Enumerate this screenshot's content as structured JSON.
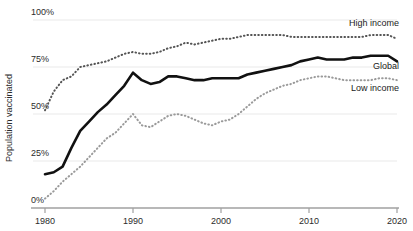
{
  "chart_data": {
    "type": "line",
    "title": "",
    "subtitle": "",
    "xlabel": "",
    "ylabel": "Population vaccinated",
    "xlim": [
      1980,
      2020
    ],
    "ylim": [
      0,
      100
    ],
    "grid": true,
    "grid_axis": "y",
    "legend_position": "right-inline",
    "x_ticks": [
      "1980",
      "1990",
      "2000",
      "2010",
      "2020"
    ],
    "x_tick_values": [
      1980,
      1990,
      2000,
      2010,
      2020
    ],
    "y_ticks": [
      "0%",
      "25%",
      "50%",
      "75%",
      "100%"
    ],
    "y_tick_values": [
      0,
      25,
      50,
      75,
      100
    ],
    "x": [
      1980,
      1981,
      1982,
      1983,
      1984,
      1985,
      1986,
      1987,
      1988,
      1989,
      1990,
      1991,
      1992,
      1993,
      1994,
      1995,
      1996,
      1997,
      1998,
      1999,
      2000,
      2001,
      2002,
      2003,
      2004,
      2005,
      2006,
      2007,
      2008,
      2009,
      2010,
      2011,
      2012,
      2013,
      2014,
      2015,
      2016,
      2017,
      2018,
      2019,
      2020
    ],
    "series": [
      {
        "name": "High income",
        "style": "dotted",
        "color": "#555555",
        "label_anchor_year": 2020,
        "label_anchor_value": 97,
        "values": [
          52,
          62,
          68,
          70,
          75,
          76,
          77,
          78,
          80,
          82,
          83,
          82,
          82,
          83,
          85,
          86,
          88,
          87,
          88,
          89,
          90,
          90,
          91,
          92,
          92,
          92,
          92,
          92,
          91,
          91,
          91,
          91,
          91,
          91,
          91,
          91,
          91,
          92,
          92,
          92,
          90
        ]
      },
      {
        "name": "Global",
        "style": "solid",
        "color": "#111111",
        "label_anchor_year": 2020,
        "label_anchor_value": 74,
        "values": [
          18,
          19,
          22,
          32,
          41,
          46,
          51,
          55,
          60,
          65,
          72,
          68,
          66,
          67,
          70,
          70,
          69,
          68,
          68,
          69,
          69,
          69,
          69,
          71,
          72,
          73,
          74,
          75,
          76,
          78,
          79,
          80,
          79,
          79,
          79,
          80,
          80,
          81,
          81,
          81,
          78
        ]
      },
      {
        "name": "Low income",
        "style": "dotted",
        "color": "#9a9a9a",
        "label_anchor_year": 2020,
        "label_anchor_value": 62,
        "values": [
          5,
          9,
          14,
          18,
          22,
          27,
          32,
          37,
          40,
          45,
          50,
          44,
          43,
          46,
          49,
          50,
          49,
          47,
          45,
          44,
          46,
          47,
          50,
          54,
          58,
          61,
          63,
          65,
          66,
          68,
          69,
          70,
          70,
          69,
          68,
          68,
          68,
          68,
          69,
          69,
          68
        ]
      }
    ]
  },
  "plot": {
    "left": 45,
    "right": 397,
    "top": 20,
    "bottom": 208
  },
  "colors": {
    "grid": "#e9e9e9",
    "axis": "#a0a0a0",
    "global_line": "#111111",
    "high_income_line": "#555555",
    "low_income_line": "#9a9a9a",
    "text": "#2b2b2b"
  }
}
